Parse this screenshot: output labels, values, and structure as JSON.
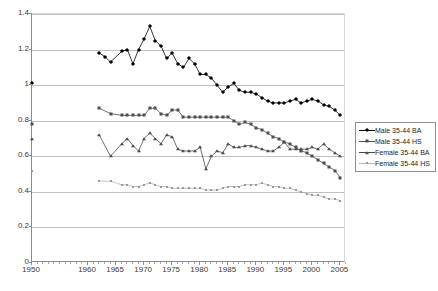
{
  "chart_data": {
    "type": "line",
    "title": "",
    "subtitle": "",
    "xlabel": "",
    "ylabel": "",
    "xlim": [
      1950,
      2006
    ],
    "ylim": [
      0,
      1.4
    ],
    "grid": true,
    "legend_position": "right",
    "y_ticks": [
      "0",
      "0.2",
      "0.4",
      "0.6",
      "0.8",
      "1",
      "1.2",
      "1.4"
    ],
    "y_tick_values": [
      0,
      0.2,
      0.4,
      0.6,
      0.8,
      1.0,
      1.2,
      1.4
    ],
    "x_ticks": [
      "1950",
      "1960",
      "1965",
      "1970",
      "1975",
      "1980",
      "1985",
      "1990",
      "1995",
      "2000",
      "2005"
    ],
    "x_tick_values": [
      1950,
      1960,
      1965,
      1970,
      1975,
      1980,
      1985,
      1990,
      1995,
      2000,
      2005
    ],
    "series": [
      {
        "name": "Male 35-44 BA",
        "marker": "diamond",
        "color": "#000000",
        "x": [
          1950,
          1962,
          1963,
          1964,
          1966,
          1967,
          1968,
          1969,
          1970,
          1971,
          1972,
          1973,
          1974,
          1975,
          1976,
          1977,
          1978,
          1979,
          1980,
          1981,
          1982,
          1983,
          1984,
          1985,
          1986,
          1987,
          1988,
          1989,
          1990,
          1991,
          1992,
          1993,
          1994,
          1995,
          1996,
          1997,
          1998,
          1999,
          2000,
          2001,
          2002,
          2003,
          2004,
          2005
        ],
        "values": [
          1.01,
          1.18,
          1.16,
          1.13,
          1.19,
          1.2,
          1.12,
          1.2,
          1.26,
          1.33,
          1.25,
          1.22,
          1.15,
          1.18,
          1.12,
          1.1,
          1.15,
          1.12,
          1.06,
          1.06,
          1.04,
          1.0,
          0.96,
          0.99,
          1.01,
          0.97,
          0.96,
          0.96,
          0.95,
          0.93,
          0.91,
          0.9,
          0.9,
          0.9,
          0.91,
          0.92,
          0.9,
          0.91,
          0.92,
          0.91,
          0.89,
          0.88,
          0.86,
          0.83
        ]
      },
      {
        "name": "Male 35-44 HS",
        "marker": "square",
        "color": "#4d4d4d",
        "x": [
          1950,
          1962,
          1964,
          1966,
          1967,
          1968,
          1969,
          1970,
          1971,
          1972,
          1973,
          1974,
          1975,
          1976,
          1977,
          1978,
          1979,
          1980,
          1981,
          1982,
          1983,
          1984,
          1985,
          1986,
          1987,
          1988,
          1989,
          1990,
          1991,
          1992,
          1993,
          1994,
          1995,
          1996,
          1997,
          1998,
          1999,
          2000,
          2001,
          2002,
          2003,
          2004,
          2005
        ],
        "values": [
          0.78,
          0.87,
          0.84,
          0.83,
          0.83,
          0.83,
          0.83,
          0.83,
          0.87,
          0.87,
          0.84,
          0.83,
          0.86,
          0.86,
          0.82,
          0.82,
          0.82,
          0.82,
          0.82,
          0.82,
          0.82,
          0.82,
          0.82,
          0.8,
          0.78,
          0.79,
          0.78,
          0.76,
          0.75,
          0.73,
          0.71,
          0.7,
          0.68,
          0.67,
          0.65,
          0.63,
          0.62,
          0.6,
          0.58,
          0.56,
          0.54,
          0.52,
          0.48
        ]
      },
      {
        "name": "Female 35-44 BA",
        "marker": "triangle",
        "color": "#4a4a4a",
        "x": [
          1950,
          1962,
          1964,
          1966,
          1967,
          1968,
          1969,
          1970,
          1971,
          1972,
          1973,
          1974,
          1975,
          1976,
          1977,
          1978,
          1979,
          1980,
          1981,
          1982,
          1983,
          1984,
          1985,
          1986,
          1987,
          1988,
          1989,
          1990,
          1991,
          1992,
          1993,
          1994,
          1995,
          1996,
          1997,
          1998,
          1999,
          2000,
          2001,
          2002,
          2003,
          2004,
          2005
        ],
        "values": [
          0.7,
          0.72,
          0.6,
          0.67,
          0.7,
          0.66,
          0.63,
          0.7,
          0.73,
          0.7,
          0.67,
          0.72,
          0.71,
          0.64,
          0.63,
          0.63,
          0.63,
          0.65,
          0.53,
          0.6,
          0.63,
          0.62,
          0.67,
          0.65,
          0.65,
          0.66,
          0.66,
          0.65,
          0.64,
          0.63,
          0.63,
          0.65,
          0.68,
          0.64,
          0.64,
          0.64,
          0.64,
          0.65,
          0.64,
          0.67,
          0.64,
          0.62,
          0.6
        ]
      },
      {
        "name": "Female 35-44 HS",
        "marker": "dot",
        "color": "#9a9a9a",
        "x": [
          1950,
          1962,
          1964,
          1966,
          1967,
          1968,
          1969,
          1970,
          1971,
          1972,
          1973,
          1974,
          1975,
          1976,
          1977,
          1978,
          1979,
          1980,
          1981,
          1982,
          1983,
          1984,
          1985,
          1986,
          1987,
          1988,
          1989,
          1990,
          1991,
          1992,
          1993,
          1994,
          1995,
          1996,
          1997,
          1998,
          1999,
          2000,
          2001,
          2002,
          2003,
          2004,
          2005
        ],
        "values": [
          0.52,
          0.46,
          0.46,
          0.44,
          0.44,
          0.43,
          0.43,
          0.44,
          0.45,
          0.44,
          0.43,
          0.43,
          0.42,
          0.42,
          0.42,
          0.42,
          0.42,
          0.42,
          0.41,
          0.41,
          0.41,
          0.42,
          0.43,
          0.43,
          0.43,
          0.44,
          0.44,
          0.44,
          0.45,
          0.44,
          0.43,
          0.43,
          0.42,
          0.42,
          0.41,
          0.4,
          0.39,
          0.38,
          0.38,
          0.37,
          0.36,
          0.36,
          0.35
        ]
      }
    ]
  },
  "legend": {
    "items": [
      {
        "label": "Male 35-44 BA"
      },
      {
        "label": "Male 35-44 HS"
      },
      {
        "label": "Female 35-44 BA"
      },
      {
        "label": "Female 35-44 HS"
      }
    ]
  }
}
